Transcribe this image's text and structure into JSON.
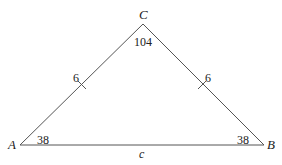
{
  "diagram": {
    "type": "triangle",
    "vertices": {
      "A": {
        "label": "A",
        "angle": "38"
      },
      "B": {
        "label": "B",
        "angle": "38"
      },
      "C": {
        "label": "C",
        "angle": "104"
      }
    },
    "sides": {
      "AC": {
        "label": "6",
        "tick": true
      },
      "BC": {
        "label": "6",
        "tick": true
      },
      "AB": {
        "label": "c"
      }
    },
    "colors": {
      "line": "#555555",
      "text": "#222222"
    }
  }
}
